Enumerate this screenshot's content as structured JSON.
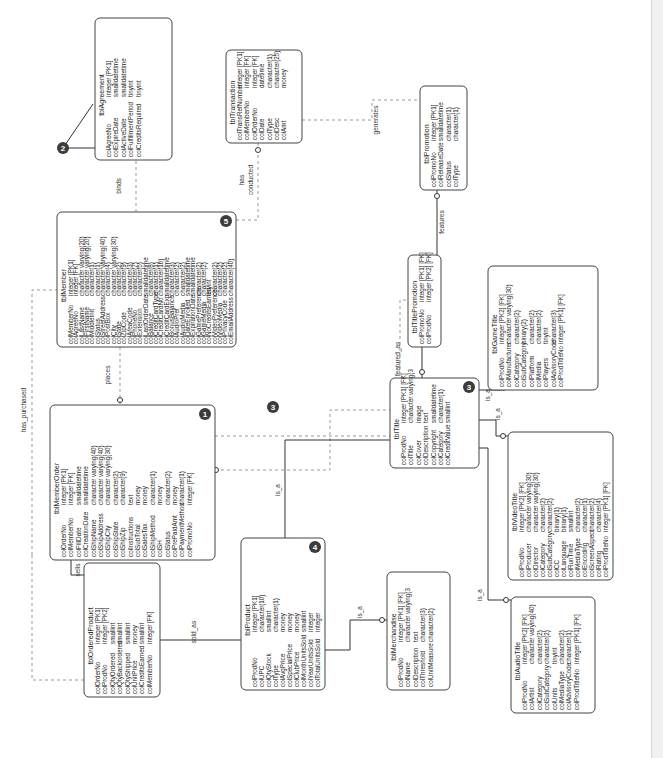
{
  "diagram": {
    "type": "ER diagram (rotated 90° counter-clockwise)",
    "entities": {
      "agreement": {
        "name": "tblAgreement",
        "attrs": [
          [
            "colAgreeNo",
            "integer [PK1]"
          ],
          [
            "colExpireDate",
            "smalldatetime"
          ],
          [
            "colActiveDate",
            "smalldatetime"
          ],
          [
            "colFulfillmentPeriod",
            "tinyint"
          ],
          [
            "colCreditsRequired",
            "tinyint"
          ]
        ]
      },
      "transaction": {
        "name": "tblTransaction",
        "attrs": [
          [
            "colTransRefNumber",
            "integer [PK1]"
          ],
          [
            "colMemberNo",
            "integer [FK]"
          ],
          [
            "colOrderNo",
            "integer [FK]"
          ],
          [
            "colDate",
            "datetime"
          ],
          [
            "colType",
            "character(1)"
          ],
          [
            "colDesc",
            "character(25)"
          ],
          [
            "colAmt",
            "money"
          ]
        ]
      },
      "promotion": {
        "name": "tblPromotion",
        "attrs": [
          [
            "colPromoNo",
            "integer [PK1]"
          ],
          [
            "colReleaseDate",
            "smalldatetime"
          ],
          [
            "colStatus",
            "character(1)"
          ],
          [
            "colType",
            "character(1)"
          ]
        ]
      },
      "member": {
        "name": "tblMember",
        "badge": "5",
        "attrs": [
          [
            "colMemberNo",
            "integer [PK1]"
          ],
          [
            "colAgreeNo",
            "integer [FK]"
          ],
          [
            "colLastName",
            "character varying(20)"
          ],
          [
            "colFirstName",
            "character varying(20)"
          ],
          [
            "colMiddleInit",
            "character(1)"
          ],
          [
            "colStatus",
            "character(1)"
          ],
          [
            "colStreetAddress",
            "character varying(40)"
          ],
          [
            "colPostBox",
            "character(4)"
          ],
          [
            "colCity",
            "character varying(30)"
          ],
          [
            "colState",
            "character(2)"
          ],
          [
            "colZipCode",
            "character(9)"
          ],
          [
            "colAreaCode",
            "character(3)"
          ],
          [
            "colPhoneNo",
            "character(7)"
          ],
          [
            "colExtension",
            "character(5)"
          ],
          [
            "colLastOrderDate",
            "smalldatetime"
          ],
          [
            "colBalance",
            "character(8)"
          ],
          [
            "colCreditCardType",
            "character(1)"
          ],
          [
            "colCreditCardNo",
            "character(16)"
          ],
          [
            "colCreditCardExp",
            "smalldatetime"
          ],
          [
            "colBonusBalance",
            "character(3)"
          ],
          [
            "colAudioPref",
            "character(2)"
          ],
          [
            "colAudioMedia",
            "character(2)"
          ],
          [
            "colDateEnrolled",
            "smalldatetime"
          ],
          [
            "colExpirationDate",
            "smalldatetime"
          ],
          [
            "colGamePreference",
            "character(2)"
          ],
          [
            "colGameMedia",
            "character(2)"
          ],
          [
            "colNoCreditsEarned",
            "tinyint"
          ],
          [
            "colVideoPreference",
            "character(2)"
          ],
          [
            "colVideoMedia",
            "character(2)"
          ],
          [
            "colPrivacyCode",
            "character(2)"
          ],
          [
            "colEmailAddress",
            "character(40)"
          ]
        ]
      },
      "memberOrder": {
        "name": "tblMemberOrder",
        "badge": "1",
        "attrs": [
          [
            "colOrderNo",
            "integer [PK1]"
          ],
          [
            "colMemberNo",
            "integer [FK]"
          ],
          [
            "colFillDate",
            "smalldatetime"
          ],
          [
            "colCreationDate",
            "smalldatetime"
          ],
          [
            "colShipName",
            "character varying(40)"
          ],
          [
            "colShipAddress",
            "character varying(40)"
          ],
          [
            "colShipCity",
            "character varying(30)"
          ],
          [
            "colShipState",
            "character(2)"
          ],
          [
            "colShipZip",
            "character(9)"
          ],
          [
            "colInstructions",
            "text"
          ],
          [
            "colSubTotal",
            "money"
          ],
          [
            "colSalesTax",
            "money"
          ],
          [
            "colShipMethod",
            "character(1)"
          ],
          [
            "colSH",
            "money"
          ],
          [
            "colStatus",
            "character(2)"
          ],
          [
            "colPrePaidAmt",
            "money"
          ],
          [
            "colPaymentMethod",
            "character(1)"
          ],
          [
            "colPromoNo",
            "integer [FK]"
          ]
        ]
      },
      "orderedProduct": {
        "name": "tblOrderedProduct",
        "attrs": [
          [
            "colOrderNo",
            "integer [PK1]"
          ],
          [
            "colProdNo",
            "integer [PK2]"
          ],
          [
            "colQtyOrdered",
            "smallint"
          ],
          [
            "colQtyBackordered",
            "smallint"
          ],
          [
            "colQtyShipped",
            "smallint"
          ],
          [
            "colUnitPrice",
            "money"
          ],
          [
            "colCreditsEarned",
            "smallint"
          ],
          [
            "colMemberNo",
            "integer [FK]"
          ]
        ]
      },
      "product": {
        "name": "tblProduct",
        "badge": "4",
        "attrs": [
          [
            "colProdNo",
            "integer [PK1]"
          ],
          [
            "colUPC",
            "character(10)"
          ],
          [
            "colQtyStock",
            "smallint"
          ],
          [
            "colType",
            "character(1)"
          ],
          [
            "colAvgPrice",
            "money"
          ],
          [
            "colSpecialPrice",
            "money"
          ],
          [
            "colClubPrice",
            "money"
          ],
          [
            "colMonthUnitsSold",
            "smallint"
          ],
          [
            "colYearUnitsSold",
            "integer"
          ],
          [
            "colTotalUnitsSold",
            "integer"
          ]
        ]
      },
      "merchandise": {
        "name": "tblMerchandise",
        "attrs": [
          [
            "colProdNo",
            "integer [PK1] [FK]"
          ],
          [
            "colName",
            "character varying(3"
          ],
          [
            "colDescription",
            "text"
          ],
          [
            "colThreshold",
            "character(3)"
          ],
          [
            "colUnitMeasure",
            "character(2)"
          ]
        ]
      },
      "title": {
        "name": "tblTitle",
        "badge": "3",
        "attrs": [
          [
            "colProdNo",
            "integer [PK1] [FK]"
          ],
          [
            "colTitle",
            "character varying(3"
          ],
          [
            "colCover",
            "image"
          ],
          [
            "colDescription",
            "text"
          ],
          [
            "colCopyright",
            "smalldatetime"
          ],
          [
            "colCategory",
            "character(1)"
          ],
          [
            "colCreditValue",
            "smallint"
          ]
        ]
      },
      "titlePromotion": {
        "name": "tblTitlePromotion",
        "attrs": [
          [
            "colPromoNo",
            "integer [PK1] [FK]"
          ],
          [
            "colProdNo",
            "integer [PK2] [FK]"
          ]
        ]
      },
      "gameTitle": {
        "name": "tblGameTitle",
        "attrs": [
          [
            "colProdNo",
            "integer [PK2] [FK]"
          ],
          [
            "colManufacturer",
            "character varying(30)"
          ],
          [
            "colCategory",
            "character(2)"
          ],
          [
            "colSubCategory",
            "binary(2)"
          ],
          [
            "colPlatform",
            "character(2)"
          ],
          [
            "colMedia",
            "character(2)"
          ],
          [
            "colPlayers",
            "tinyint"
          ],
          [
            "colAdvisoryCode",
            "character(3)"
          ],
          [
            "colProdTitleNo",
            "integer [PK1] [FK]"
          ]
        ]
      },
      "videoTitle": {
        "name": "tblVideoTitle",
        "attrs": [
          [
            "colProdNo",
            "integer [PK2] [FK]"
          ],
          [
            "colProducer",
            "character varying(30)"
          ],
          [
            "colDirector",
            "character varying(30)"
          ],
          [
            "colCategory",
            "character(2)"
          ],
          [
            "colSubCategory",
            "character(2)"
          ],
          [
            "colCC",
            "binary(1)"
          ],
          [
            "colLanguage",
            "binary(1)"
          ],
          [
            "colRunTime",
            "smallint"
          ],
          [
            "colMediaType",
            "character(2)"
          ],
          [
            "colEncoding",
            "character(1)"
          ],
          [
            "colScreenAspect",
            "character(2)"
          ],
          [
            "colRating",
            "character(4)"
          ],
          [
            "colProdTitleNo",
            "integer [PK1] [FK]"
          ]
        ]
      },
      "audioTitle": {
        "name": "tblAudioTitle",
        "attrs": [
          [
            "colProdNo",
            "integer [PK2] [FK]"
          ],
          [
            "colArtist",
            "character varying(40)"
          ],
          [
            "colCategory",
            "character(2)"
          ],
          [
            "colSubCategory",
            "character(2)"
          ],
          [
            "colUnits",
            "tinyint"
          ],
          [
            "colMediaType",
            "character(2)"
          ],
          [
            "colAdvisoryCode",
            "character(1)"
          ],
          [
            "colProdTitleNo",
            "integer [PK1] [FK]"
          ]
        ]
      }
    },
    "relationships": {
      "binds": "binds",
      "has_conducted_1": "has",
      "has_conducted_2": "conducted",
      "generates": "generates",
      "features": "features",
      "places": "places",
      "is_featured_as": "is_featured_as",
      "has_purchased": "has_purchased",
      "sells": "sells",
      "sold_as": "sold_as",
      "is_a_product_title": "is_a",
      "is_a_product_merch": "is_a",
      "is_a_member_title": "is_a",
      "is_a_game": "is_a",
      "is_a_video": "is_a",
      "is_a_audio": "is_a"
    },
    "callouts": {
      "c2": "2"
    }
  },
  "colors": {
    "line": "#333333",
    "dashed_line": "#999999",
    "badge": "#3c3c3c",
    "scrollbar": "#f0f0f0"
  }
}
